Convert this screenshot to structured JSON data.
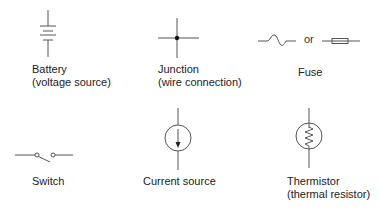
{
  "colors": {
    "stroke": "#555555",
    "text": "#222222",
    "background": "#ffffff"
  },
  "symbols": [
    {
      "id": "battery",
      "icon": "battery-icon",
      "lines": [
        "Battery",
        "(voltage source)"
      ]
    },
    {
      "id": "junction",
      "icon": "junction-icon",
      "lines": [
        "Junction",
        "(wire connection)"
      ]
    },
    {
      "id": "fuse",
      "icon": "fuse-icon",
      "lines": [
        "Fuse"
      ],
      "separator": "or"
    },
    {
      "id": "switch",
      "icon": "switch-icon",
      "lines": [
        "Switch"
      ]
    },
    {
      "id": "current-source",
      "icon": "current-source-icon",
      "lines": [
        "Current source"
      ]
    },
    {
      "id": "thermistor",
      "icon": "thermistor-icon",
      "lines": [
        "Thermistor",
        "(thermal resistor)"
      ]
    }
  ]
}
